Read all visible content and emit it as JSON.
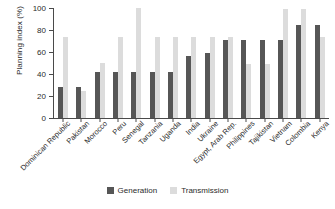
{
  "chart_data": {
    "type": "bar",
    "title": "",
    "xlabel": "",
    "ylabel": "Planning index (%)",
    "ylim": [
      0,
      100
    ],
    "yticks": [
      0,
      20,
      40,
      60,
      80,
      100
    ],
    "grid": false,
    "legend_position": "bottom-center",
    "categories": [
      "Dominican Republic",
      "Pakistan",
      "Morocco",
      "Peru",
      "Senegal",
      "Tanzania",
      "Uganda",
      "India",
      "Ukraine",
      "Egypt, Arab Rep.",
      "Philippines",
      "Tajikistan",
      "Vietnam",
      "Colombia",
      "Kenya"
    ],
    "series": [
      {
        "name": "Generation",
        "color": "#565656",
        "values": [
          28,
          28,
          42,
          42,
          42,
          42,
          42,
          56,
          59,
          71,
          71,
          71,
          71,
          85,
          85
        ]
      },
      {
        "name": "Transmission",
        "color": "#dcdcdc",
        "values": [
          74,
          25,
          50,
          74,
          100,
          74,
          74,
          74,
          74,
          74,
          49,
          49,
          99,
          99,
          74
        ]
      }
    ]
  },
  "legend": {
    "items": [
      {
        "label": "Generation"
      },
      {
        "label": "Transmission"
      }
    ]
  }
}
